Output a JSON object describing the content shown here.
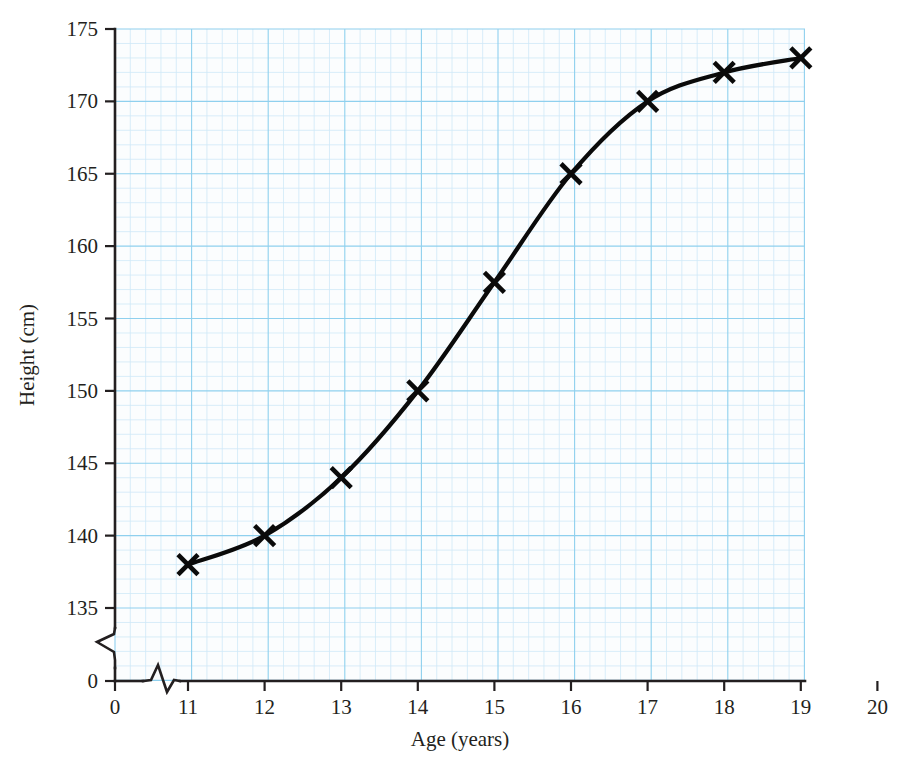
{
  "chart_data": {
    "type": "line",
    "title": "",
    "xlabel": "Age (years)",
    "ylabel": "Height (cm)",
    "x": [
      11,
      12,
      13,
      14,
      15,
      16,
      17,
      18,
      19
    ],
    "values": [
      138,
      140,
      144,
      150,
      157.5,
      165,
      170,
      172,
      173
    ],
    "series": [
      {
        "name": "Height",
        "x": [
          11,
          12,
          13,
          14,
          15,
          16,
          17,
          18,
          19
        ],
        "values": [
          138,
          140,
          144,
          150,
          157.5,
          165,
          170,
          172,
          173
        ]
      }
    ],
    "xlim": [
      0,
      20
    ],
    "ylim": [
      135,
      175
    ],
    "x_ticks": [
      "0",
      "11",
      "12",
      "13",
      "14",
      "15",
      "16",
      "17",
      "18",
      "19",
      "20"
    ],
    "x_tick_values": [
      0,
      11,
      12,
      13,
      14,
      15,
      16,
      17,
      18,
      19,
      20
    ],
    "y_ticks": [
      "0",
      "135",
      "140",
      "145",
      "150",
      "155",
      "160",
      "165",
      "170",
      "175"
    ],
    "y_tick_values": [
      0,
      135,
      140,
      145,
      150,
      155,
      160,
      165,
      170,
      175
    ],
    "grid": true,
    "grid_minor_step": 1,
    "grid_major_step": 5,
    "legend": "none",
    "marker": "x-cross",
    "x_axis_break": true,
    "y_axis_break": true,
    "colors": {
      "grid_minor": "#cfe9f7",
      "grid_major": "#8fd0ee",
      "axis": "#231f20",
      "curve": "#0a0a0a",
      "marker": "#0a0a0a",
      "background": "#ffffff",
      "plot_background": "#fbfdfe"
    }
  }
}
